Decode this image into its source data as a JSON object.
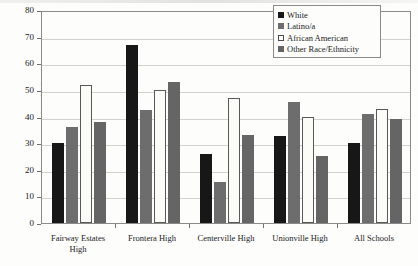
{
  "chart_data": {
    "type": "bar",
    "title": "",
    "xlabel": "",
    "ylabel": "% of Students",
    "ylim": [
      0,
      80
    ],
    "yticks": [
      0,
      10,
      20,
      30,
      40,
      50,
      60,
      70,
      80
    ],
    "grid": true,
    "legend_position": "top-right",
    "categories": [
      "Fairway Estates High",
      "Frontera High",
      "Centerville High",
      "Unionville High",
      "All Schools"
    ],
    "category_lines": [
      [
        "Fairway Estates",
        "High"
      ],
      [
        "Frontera High"
      ],
      [
        "Centerville High"
      ],
      [
        "Unionville High"
      ],
      [
        "All Schools"
      ]
    ],
    "series": [
      {
        "name": "White",
        "color": "#171717",
        "values": [
          30,
          67,
          26,
          32.5,
          30
        ]
      },
      {
        "name": "Latino/a",
        "color": "#6d6d6d",
        "values": [
          36,
          42.5,
          15.5,
          45.5,
          41
        ]
      },
      {
        "name": "African American",
        "color": "#fbfbf7",
        "values": [
          52,
          50,
          47,
          40,
          43
        ]
      },
      {
        "name": "Other Race/Ethnicity",
        "color": "#656565",
        "values": [
          38,
          53,
          33,
          25,
          39
        ]
      }
    ]
  },
  "legend": {
    "items": [
      {
        "label": "White"
      },
      {
        "label": "Latino/a"
      },
      {
        "label": "African American"
      },
      {
        "label": "Other Race/Ethnicity"
      }
    ]
  }
}
